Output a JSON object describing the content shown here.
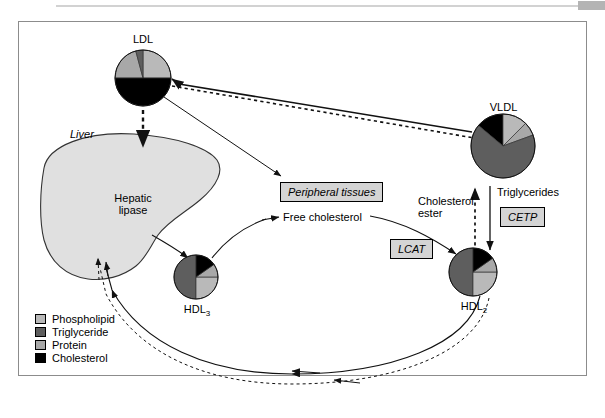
{
  "figure": {
    "title_label": "Lipoprotein metabolism pathway diagram",
    "particles": [
      {
        "id": "ldl",
        "label": "LDL",
        "label_sub": "",
        "cx": 143,
        "cy": 78,
        "r": 28,
        "slices": [
          {
            "component": "Phospholipid",
            "color": "#b9b9b9",
            "start_deg": 0,
            "end_deg": 90
          },
          {
            "component": "Protein",
            "color": "#a8a8a8",
            "start_deg": 270,
            "end_deg": 345
          },
          {
            "component": "Triglyceride",
            "color": "#5e5e5e",
            "start_deg": 345,
            "end_deg": 360
          },
          {
            "component": "Cholesterol",
            "color": "#000000",
            "start_deg": 90,
            "end_deg": 270
          }
        ]
      },
      {
        "id": "vldl",
        "label": "VLDL",
        "label_sub": "",
        "cx": 503,
        "cy": 146,
        "r": 32,
        "slices": [
          {
            "component": "Cholesterol",
            "color": "#000000",
            "start_deg": 310,
            "end_deg": 360
          },
          {
            "component": "Phospholipid",
            "color": "#b9b9b9",
            "start_deg": 0,
            "end_deg": 45
          },
          {
            "component": "Protein",
            "color": "#a8a8a8",
            "start_deg": 45,
            "end_deg": 70
          },
          {
            "component": "Triglyceride",
            "color": "#5e5e5e",
            "start_deg": 70,
            "end_deg": 310
          }
        ]
      },
      {
        "id": "hdl3",
        "label": "HDL",
        "label_sub": "3",
        "cx": 196,
        "cy": 277,
        "r": 22,
        "slices": [
          {
            "component": "Triglyceride",
            "color": "#5e5e5e",
            "start_deg": 180,
            "end_deg": 360
          },
          {
            "component": "Phospholipid",
            "color": "#b9b9b9",
            "start_deg": 90,
            "end_deg": 180
          },
          {
            "component": "Protein",
            "color": "#a8a8a8",
            "start_deg": 55,
            "end_deg": 90
          },
          {
            "component": "Cholesterol",
            "color": "#000000",
            "start_deg": 0,
            "end_deg": 55
          }
        ]
      },
      {
        "id": "hdl2",
        "label": "HDL",
        "label_sub": "2",
        "cx": 473,
        "cy": 272,
        "r": 24,
        "slices": [
          {
            "component": "Triglyceride",
            "color": "#5e5e5e",
            "start_deg": 180,
            "end_deg": 360
          },
          {
            "component": "Phospholipid",
            "color": "#b9b9b9",
            "start_deg": 90,
            "end_deg": 180
          },
          {
            "component": "Protein",
            "color": "#a8a8a8",
            "start_deg": 55,
            "end_deg": 90
          },
          {
            "component": "Cholesterol",
            "color": "#000000",
            "start_deg": 0,
            "end_deg": 55
          }
        ]
      }
    ],
    "text_labels": {
      "liver": "Liver",
      "hepatic_lipase": "Hepatic\nlipase",
      "hepatic_lipase_line1": "Hepatic",
      "hepatic_lipase_line2": "lipase",
      "free_cholesterol": "Free cholesterol",
      "cholesterol_ester_line1": "Cholesterol",
      "cholesterol_ester_line2": "ester",
      "triglycerides": "Triglycerides"
    },
    "boxes": {
      "peripheral_tissues": "Peripheral tissues",
      "lcat": "LCAT",
      "cetp": "CETP"
    },
    "legend": {
      "items": [
        {
          "label": "Phospholipid",
          "color": "#b9b9b9"
        },
        {
          "label": "Triglyceride",
          "color": "#5e5e5e"
        },
        {
          "label": "Protein",
          "color": "#a8a8a8"
        },
        {
          "label": "Cholesterol",
          "color": "#000000"
        }
      ]
    },
    "colors": {
      "liver_fill": "#e0e0e0",
      "box_fill": "#d4d4d4",
      "frame_border": "#8c8c8c",
      "stroke": "#1a1a1a"
    }
  }
}
